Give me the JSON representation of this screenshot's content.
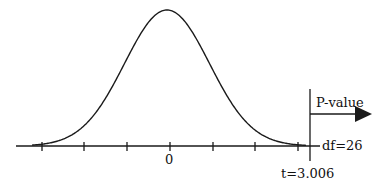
{
  "diagram": {
    "type": "t-distribution-curve",
    "center_label": "0",
    "pvalue_label": "P-value",
    "df_label": "df=26",
    "t_label": "t=3.006",
    "line_color": "#1a1a1a"
  },
  "chart_data": {
    "type": "line",
    "title": "",
    "df": 26,
    "t_statistic": 3.006,
    "x_tick_count": 7,
    "x_tick_labels": [
      "",
      "",
      "",
      "0",
      "",
      "",
      ""
    ],
    "annotations": [
      "P-value",
      "df=26",
      "t=3.006"
    ],
    "tail": "right",
    "grid": false
  }
}
